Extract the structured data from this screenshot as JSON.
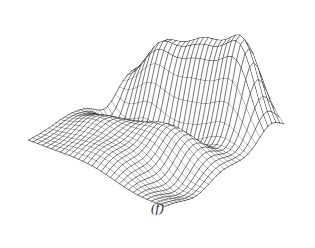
{
  "figure": {
    "caption": "(f)",
    "caption_style": "italic",
    "kind": "3d-wireframe-surface",
    "background_color": "#ffffff",
    "line_color": "#242424",
    "ridge_line_color": "#0d0d0d",
    "width_px": 315,
    "height_px": 248
  },
  "chart_data": {
    "type": "line",
    "title": "",
    "subtitle": "",
    "xlabel": "",
    "ylabel": "",
    "zlabel": "",
    "render": "wireframe-mesh-hidden-line",
    "grid": true,
    "legend": null,
    "annotations": [
      "(f)"
    ],
    "surface": {
      "description": "Smooth undulating height field rendered as a hidden-line wireframe mesh viewed from an elevated oblique angle; a pronounced double-humped ridge runs along the far (back) edge with a deep trough immediately in front of it, and gentle rolling waves fill the near half of the domain.",
      "nu": 30,
      "nv": 30,
      "u_range": [
        -1,
        1
      ],
      "v_range": [
        -1,
        1
      ],
      "z_range": [
        -0.42,
        1.0
      ],
      "components": [
        {
          "name": "back-ridge-main",
          "amp": 1.0,
          "cx": 0.08,
          "cy": -0.8,
          "sx": 0.52,
          "sy": 0.3
        },
        {
          "name": "back-ridge-right",
          "amp": 0.88,
          "cx": 0.62,
          "cy": -0.78,
          "sx": 0.3,
          "sy": 0.26
        },
        {
          "name": "back-ridge-left",
          "amp": 0.46,
          "cx": -0.58,
          "cy": -0.72,
          "sx": 0.3,
          "sy": 0.26
        },
        {
          "name": "front-trough",
          "amp": -0.46,
          "cx": -0.05,
          "cy": -0.34,
          "sx": 0.55,
          "sy": 0.22
        },
        {
          "name": "left-dip",
          "amp": -0.34,
          "cx": -0.78,
          "cy": -0.3,
          "sx": 0.26,
          "sy": 0.24
        },
        {
          "name": "mid-swell",
          "amp": 0.3,
          "cx": 0.3,
          "cy": 0.1,
          "sx": 0.58,
          "sy": 0.34
        },
        {
          "name": "near-left-swell",
          "amp": 0.22,
          "cx": -0.55,
          "cy": 0.35,
          "sx": 0.4,
          "sy": 0.32
        },
        {
          "name": "near-right-dip",
          "amp": -0.2,
          "cx": 0.7,
          "cy": 0.45,
          "sx": 0.38,
          "sy": 0.34
        },
        {
          "name": "front-swell",
          "amp": 0.16,
          "cx": -0.05,
          "cy": 0.78,
          "sx": 0.5,
          "sy": 0.3
        }
      ],
      "ripple": {
        "amp": 0.055,
        "ku": 3.1,
        "kv": 2.7,
        "phase": 0.6
      }
    },
    "projection": {
      "type": "oblique-axonometric",
      "origin_x": 150,
      "origin_y": 150,
      "u_axis": [
        4.55,
        2.18
      ],
      "v_axis": [
        -3.95,
        2.42
      ],
      "z_scale": -74,
      "x_shift": 6,
      "y_shift": -12
    }
  }
}
